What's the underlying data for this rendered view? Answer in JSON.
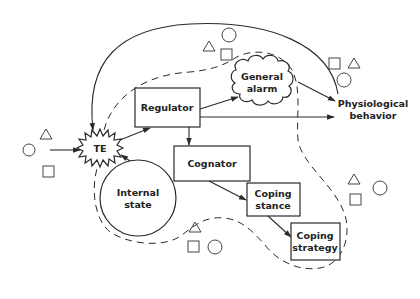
{
  "diagram": {
    "nodes": {
      "te": {
        "label": "TE"
      },
      "regulator": {
        "label": "Regulator"
      },
      "cognator": {
        "label": "Cognator"
      },
      "general_alarm": {
        "line1": "General",
        "line2": "alarm"
      },
      "physiological_behavior": {
        "line1": "Physiological",
        "line2": "behavior"
      },
      "internal_state": {
        "line1": "Internal",
        "line2": "state"
      },
      "coping_stance": {
        "line1": "Coping",
        "line2": "stance"
      },
      "coping_strategy": {
        "line1": "Coping",
        "line2": "strategy"
      }
    },
    "edges": [
      {
        "from": "environment",
        "to": "te"
      },
      {
        "from": "te",
        "to": "regulator"
      },
      {
        "from": "internal_state",
        "to": "te"
      },
      {
        "from": "regulator",
        "to": "general_alarm"
      },
      {
        "from": "regulator",
        "to": "cognator"
      },
      {
        "from": "regulator",
        "to": "physiological_behavior"
      },
      {
        "from": "general_alarm",
        "to": "physiological_behavior"
      },
      {
        "from": "cognator",
        "to": "coping_stance"
      },
      {
        "from": "coping_stance",
        "to": "coping_strategy"
      },
      {
        "from": "physiological_behavior",
        "to": "te",
        "style": "solid curved feedback"
      }
    ],
    "environment_symbols": [
      "triangle",
      "circle",
      "square"
    ],
    "colors": {
      "line": "#2a2a2a",
      "background": "#ffffff"
    }
  }
}
